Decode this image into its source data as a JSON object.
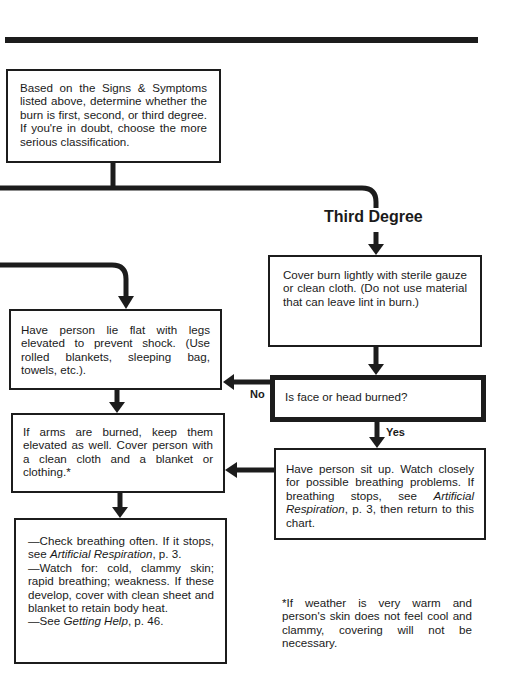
{
  "flowchart": {
    "start_box": {
      "text": "Based on the Signs & Symptoms listed above, determine whether the burn is first, second, or third degree. If you're in doubt, choose the more serious classification."
    },
    "branch_label": "Third Degree",
    "cover_box": {
      "text": "Cover burn lightly with sterile gauze or clean cloth. (Do not use material that can leave lint in burn.)"
    },
    "question_box": {
      "text": "Is face or head burned?"
    },
    "no_label": "No",
    "yes_label": "Yes",
    "shock_box": {
      "text": "Have person lie flat with legs elevated to prevent shock. (Use rolled blankets, sleeping bag, towels, etc.)."
    },
    "sit_box": {
      "text_a": "Have person sit up. Watch closely for possible breathing problems. If breathing stops, see ",
      "italic_a": "Artificial Respiration",
      "text_b": ", p. 3, then return to this chart."
    },
    "arms_box": {
      "text": "If arms are burned, keep them elevated as well. Cover person with a clean cloth and a blanket or clothing.*"
    },
    "final_box": {
      "item1_a": "—Check breathing often. If it stops, see ",
      "item1_italic": "Artificial Respiration",
      "item1_b": ", p. 3.",
      "item2": "—Watch for: cold, clammy skin; rapid breathing; weakness. If these develop, cover with clean sheet and blanket to retain body heat.",
      "item3_a": "—See ",
      "item3_italic": "Getting Help",
      "item3_b": ", p. 46."
    },
    "footnote": "*If weather is very warm and person's skin does not feel cool and clammy, covering will not be necessary."
  }
}
